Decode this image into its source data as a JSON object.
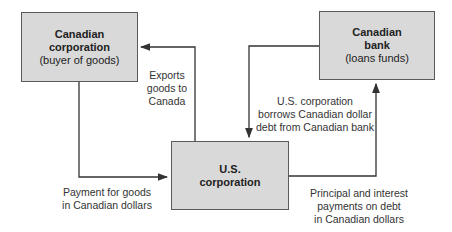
{
  "nodes": {
    "canadian_corp": {
      "title_line1": "Canadian",
      "title_line2": "corporation",
      "subtitle": "(buyer of goods)"
    },
    "canadian_bank": {
      "title_line1": "Canadian",
      "title_line2": "bank",
      "subtitle": "(loans funds)"
    },
    "us_corp": {
      "title_line1": "U.S.",
      "title_line2": "corporation"
    }
  },
  "edges": {
    "exports": {
      "line1": "Exports",
      "line2": "goods to",
      "line3": "Canada"
    },
    "borrows": {
      "line1": "U.S. corporation",
      "line2": "borrows Canadian dollar",
      "line3": "debt from Canadian bank"
    },
    "payment": {
      "line1": "Payment for goods",
      "line2": "in Canadian dollars"
    },
    "principal": {
      "line1": "Principal and interest",
      "line2": "payments on debt",
      "line3": "in Canadian dollars"
    }
  },
  "colors": {
    "box_fill": "#d9d9d9",
    "line": "#333333"
  }
}
